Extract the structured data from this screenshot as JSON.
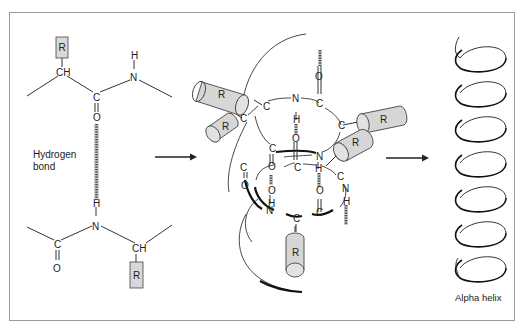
{
  "figure": {
    "type": "diagram",
    "labels": {
      "hydrogen_bond_line1": "Hydrogen",
      "hydrogen_bond_line2": "bond",
      "alpha_helix": "Alpha helix"
    },
    "top_peptide": {
      "side_chain": "R",
      "alpha_carbon": "CH",
      "carbonyl_carbon": "C",
      "carbonyl_oxygen": "O",
      "amide_nitrogen": "N",
      "amide_hydrogen": "H"
    },
    "bottom_peptide": {
      "amide_hydrogen": "H",
      "amide_nitrogen": "N",
      "carbonyl_carbon": "C",
      "carbonyl_oxygen": "O",
      "alpha_carbon": "CH",
      "side_chain": "R"
    },
    "helix_model": {
      "side_chains": [
        "R",
        "R",
        "R",
        "R",
        "R"
      ],
      "atoms": {
        "c": "C",
        "n": "N",
        "o": "O",
        "h": "H"
      }
    },
    "helix_turns": 7,
    "colors": {
      "line": "#333333",
      "fill_gray": "#d6d6d6",
      "frame": "#9a9a9a"
    }
  }
}
